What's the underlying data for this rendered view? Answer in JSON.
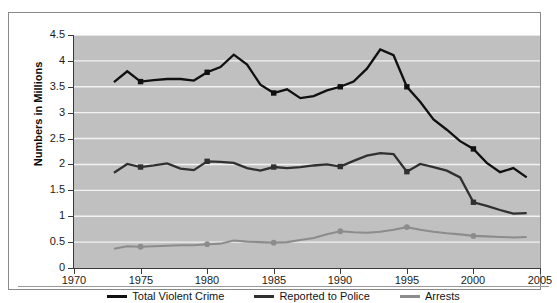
{
  "chart_data": {
    "type": "line",
    "title": "",
    "subtitle": "",
    "xlabel": "",
    "ylabel": "Numbers in Millions",
    "xlim": [
      1970,
      2005
    ],
    "ylim": [
      0,
      4.5
    ],
    "grid": true,
    "grid_axis": "y",
    "legend_position": "bottom",
    "x_ticks": [
      1970,
      1975,
      1980,
      1985,
      1990,
      1995,
      2000,
      2005
    ],
    "x_tick_labels": [
      "1970",
      "1975",
      "1980",
      "1985",
      "1990",
      "1995",
      "2000",
      "2005"
    ],
    "y_ticks": [
      0,
      0.5,
      1,
      1.5,
      2,
      2.5,
      3,
      3.5,
      4,
      4.5
    ],
    "y_tick_labels": [
      "0",
      "0.5",
      "1",
      "1.5",
      "2",
      "2.5",
      "3",
      "3.5",
      "4",
      "4.5"
    ],
    "x": [
      1973,
      1974,
      1975,
      1976,
      1977,
      1978,
      1979,
      1980,
      1981,
      1982,
      1983,
      1984,
      1985,
      1986,
      1987,
      1988,
      1989,
      1990,
      1991,
      1992,
      1993,
      1994,
      1995,
      1996,
      1997,
      1998,
      1999,
      2000,
      2001,
      2002,
      2003,
      2004
    ],
    "series": [
      {
        "name": "Total Violent Crime",
        "color": "#101010",
        "marker_years": [
          1975,
          1980,
          1985,
          1990,
          1995,
          2000
        ],
        "values": [
          3.59,
          3.8,
          3.6,
          3.63,
          3.65,
          3.65,
          3.62,
          3.78,
          3.88,
          4.12,
          3.93,
          3.54,
          3.38,
          3.45,
          3.28,
          3.32,
          3.43,
          3.5,
          3.6,
          3.85,
          4.22,
          4.11,
          3.5,
          3.21,
          2.87,
          2.67,
          2.45,
          2.3,
          2.03,
          1.85,
          1.93,
          1.75
        ]
      },
      {
        "name": "Reported to Police",
        "color": "#303030",
        "marker_years": [
          1975,
          1980,
          1985,
          1990,
          1995,
          2000
        ],
        "values": [
          1.84,
          2.01,
          1.95,
          1.98,
          2.02,
          1.92,
          1.89,
          2.06,
          2.05,
          2.03,
          1.93,
          1.88,
          1.95,
          1.93,
          1.95,
          1.98,
          2.0,
          1.96,
          2.07,
          2.17,
          2.22,
          2.2,
          1.86,
          2.01,
          1.95,
          1.88,
          1.75,
          1.27,
          1.2,
          1.12,
          1.05,
          1.06
        ]
      },
      {
        "name": "Arrests",
        "color": "#8c8c8c",
        "marker_years": [
          1975,
          1980,
          1985,
          1990,
          1995,
          2000
        ],
        "values": [
          0.37,
          0.42,
          0.41,
          0.42,
          0.43,
          0.44,
          0.44,
          0.46,
          0.47,
          0.53,
          0.51,
          0.5,
          0.49,
          0.5,
          0.54,
          0.58,
          0.65,
          0.71,
          0.69,
          0.68,
          0.7,
          0.74,
          0.79,
          0.74,
          0.7,
          0.67,
          0.65,
          0.62,
          0.61,
          0.6,
          0.59,
          0.6
        ]
      }
    ]
  },
  "axis": {
    "y_title": "Numbers in Millions"
  },
  "legend": {
    "items": [
      {
        "label": "Total Violent Crime",
        "color": "#101010"
      },
      {
        "label": "Reported to Police",
        "color": "#303030"
      },
      {
        "label": "Arrests",
        "color": "#8c8c8c"
      }
    ]
  }
}
